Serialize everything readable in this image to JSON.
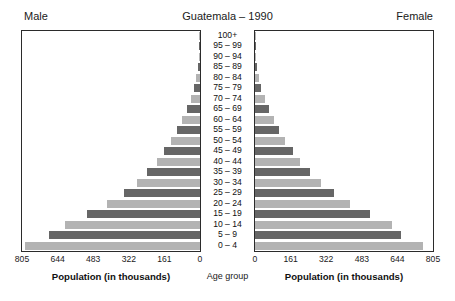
{
  "header": {
    "male_label": "Male",
    "title": "Guatemala – 1990",
    "female_label": "Female"
  },
  "center": {
    "age_group_label": "Age group"
  },
  "axis": {
    "left_title": "Population (in thousands)",
    "right_title": "Population (in thousands)",
    "left_ticks": [
      "805",
      "644",
      "483",
      "322",
      "161",
      "0"
    ],
    "right_ticks": [
      "0",
      "161",
      "322",
      "483",
      "644",
      "805"
    ]
  },
  "colors": {
    "bar_dark": "#666666",
    "bar_light": "#b3b3b3",
    "frame": "#2b2b2b",
    "text": "#1a1a1a"
  },
  "chart_data": {
    "type": "bar",
    "subtype": "population-pyramid",
    "title": "Guatemala – 1990",
    "xlabel": "Population (in thousands)",
    "ylabel": "Age group",
    "xlim": [
      0,
      805
    ],
    "xticks": [
      0,
      161,
      322,
      483,
      644,
      805
    ],
    "grid": false,
    "legend": [
      "Male",
      "Female"
    ],
    "legend_position": "top-left-and-top-right",
    "units": "thousands",
    "categories": [
      "100+",
      "95 – 99",
      "90 – 94",
      "85 – 89",
      "80 – 84",
      "75 – 79",
      "70 – 74",
      "65 – 69",
      "60 – 64",
      "55 – 59",
      "50 – 54",
      "45 – 49",
      "40 – 44",
      "35 – 39",
      "30 – 34",
      "25 – 29",
      "20 – 24",
      "15 – 19",
      "10 – 14",
      "5 – 9",
      "0 – 4"
    ],
    "series": [
      {
        "name": "Male",
        "direction": "left",
        "values": [
          1,
          2,
          4,
          9,
          16,
          26,
          42,
          60,
          80,
          103,
          129,
          161,
          196,
          238,
          286,
          345,
          419,
          510,
          612,
          684,
          790
        ]
      },
      {
        "name": "Female",
        "direction": "right",
        "values": [
          1,
          3,
          5,
          10,
          18,
          29,
          46,
          65,
          86,
          110,
          137,
          170,
          205,
          248,
          297,
          357,
          430,
          519,
          618,
          660,
          760
        ]
      }
    ]
  }
}
